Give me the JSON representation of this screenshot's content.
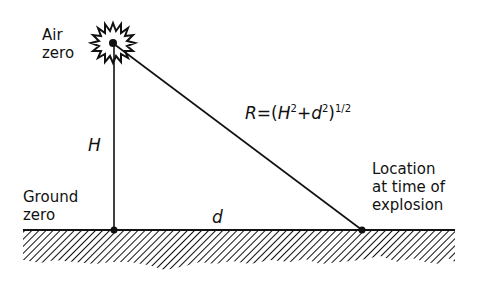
{
  "labels": {
    "air_zero_line1": "Air",
    "air_zero_line2": "zero",
    "ground_zero_line1": "Ground",
    "ground_zero_line2": "zero",
    "location_line1": "Location",
    "location_line2": "at time of",
    "location_line3": "explosion",
    "height_symbol": "H",
    "distance_symbol": "d"
  },
  "formula": {
    "lhs": "R",
    "equals": "=",
    "open": "(",
    "H": "H",
    "H_exp": "2",
    "plus": "+",
    "d": "d",
    "d_exp": "2",
    "close": ")",
    "outer_exp": "1/2"
  },
  "colors": {
    "ink": "#111111",
    "background": "#ffffff"
  }
}
